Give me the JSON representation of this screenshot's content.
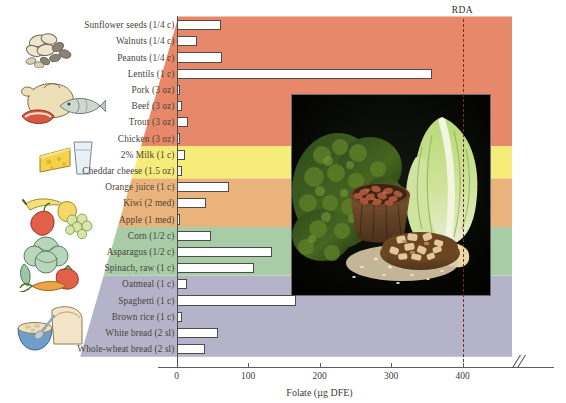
{
  "chart_data": {
    "type": "bar",
    "orientation": "horizontal",
    "title": "",
    "xlabel": "Folate (µg DFE)",
    "ylabel": "",
    "xlim": [
      0,
      420
    ],
    "xticks": [
      0,
      100,
      200,
      300,
      400
    ],
    "xtick_labels": [
      "0",
      "100",
      "200",
      "300",
      "400"
    ],
    "grid": false,
    "axis_break": true,
    "annotations": [
      {
        "name": "RDA",
        "label": "RDA",
        "value": 400,
        "style": "dashed-vertical",
        "color": "#7a2f18"
      }
    ],
    "categories": [
      "Sunflower seeds (1/4 c)",
      "Walnuts (1/4 c)",
      "Peanuts (1/4 c)",
      "Lentils (1 c)",
      "Pork (3 oz)",
      "Beef (3 oz)",
      "Trout (3 oz)",
      "Chicken (3 oz)",
      "2% Milk (1 c)",
      "Cheddar cheese (1.5 oz)",
      "Orange juice (1 c)",
      "Kiwi (2 med)",
      "Apple (1 med)",
      "Corn (1/2 c)",
      "Asparagus (1/2 c)",
      "Spinach, raw (1 c)",
      "Oatmeal (1 c)",
      "Spaghetti (1 c)",
      "Brown rice (1 c)",
      "White bread (2 sl)",
      "Whole-wheat bread (2 sl)"
    ],
    "values": [
      62,
      28,
      64,
      358,
      5,
      7,
      16,
      5,
      12,
      8,
      74,
      41,
      4,
      48,
      134,
      108,
      14,
      167,
      8,
      58,
      40
    ],
    "groups": [
      {
        "name": "protein",
        "label": "Protein foods",
        "color": "#e8886a",
        "rows": [
          0,
          7
        ]
      },
      {
        "name": "dairy",
        "label": "Dairy",
        "color": "#f6ec7a",
        "rows": [
          8,
          9
        ]
      },
      {
        "name": "fruits",
        "label": "Fruits",
        "color": "#eab37b",
        "rows": [
          10,
          12
        ]
      },
      {
        "name": "vegetables",
        "label": "Vegetables",
        "color": "#a8cda6",
        "rows": [
          13,
          15
        ]
      },
      {
        "name": "grains",
        "label": "Grains",
        "color": "#b5b3ca",
        "rows": [
          16,
          20
        ]
      }
    ]
  },
  "figure": {
    "bar_fill_color": "#ffffff",
    "bar_edge_color": "#4c4c4c",
    "axis_color": "#5c5c66",
    "label_color": "#4a4339",
    "background": "#ffffff"
  },
  "photo": {
    "name": "folate-rich-foods-photo",
    "alt": "Photograph of folate-rich foods: curly kale, a bowl of pinto beans, romaine lettuce, a dish of chopped nuts and scattered seeds on a dark background",
    "items": [
      "kale",
      "pinto beans",
      "romaine lettuce",
      "chopped nuts",
      "seeds"
    ]
  },
  "clipart": [
    {
      "name": "nuts-and-seeds-clipart",
      "group": "protein"
    },
    {
      "name": "meat-poultry-fish-clipart",
      "group": "protein"
    },
    {
      "name": "cheese-and-milk-clipart",
      "group": "dairy"
    },
    {
      "name": "fruit-basket-clipart",
      "group": "fruits"
    },
    {
      "name": "vegetables-clipart",
      "group": "vegetables"
    },
    {
      "name": "bread-and-cereal-clipart",
      "group": "grains"
    }
  ]
}
